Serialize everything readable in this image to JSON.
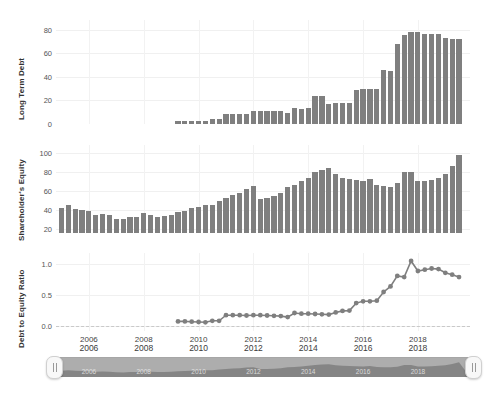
{
  "figure": {
    "background": "#ffffff",
    "bar_color": "#7f7f7f",
    "line_color": "#7f7f7f",
    "grid_color": "#f0f0f0"
  },
  "x_axis": {
    "ticks": [
      "2006",
      "2008",
      "2010",
      "2012",
      "2014",
      "2016",
      "2018"
    ],
    "tick_values": [
      2006,
      2008,
      2010,
      2012,
      2014,
      2016,
      2018
    ],
    "range": [
      2004.8,
      2019.9
    ]
  },
  "range_slider": {
    "ticks": [
      "2006",
      "2008",
      "2010",
      "2012",
      "2014",
      "2016",
      "2018"
    ],
    "inner_ticks": [
      "2006",
      "2008",
      "2010",
      "2012",
      "2014",
      "2016",
      "2018"
    ],
    "left_handle_label": "range-slider-left-handle",
    "right_handle_label": "range-slider-right-handle",
    "selected_start": "2004.8",
    "selected_end": "2019.9"
  },
  "chart_data": [
    {
      "type": "bar",
      "title": "",
      "ylabel": "Long Term Debt",
      "xlabel": "",
      "ylim": [
        0,
        88
      ],
      "yticks": [
        0,
        20,
        40,
        60,
        80
      ],
      "ytick_labels": [
        "0",
        "20",
        "40",
        "60",
        "80"
      ],
      "grid": true,
      "x": [
        2009.25,
        2009.5,
        2009.75,
        2010.0,
        2010.25,
        2010.5,
        2010.75,
        2011.0,
        2011.25,
        2011.5,
        2011.75,
        2012.0,
        2012.25,
        2012.5,
        2012.75,
        2013.0,
        2013.25,
        2013.5,
        2013.75,
        2014.0,
        2014.25,
        2014.5,
        2014.75,
        2015.0,
        2015.25,
        2015.5,
        2015.75,
        2016.0,
        2016.25,
        2016.5,
        2016.75,
        2017.0,
        2017.25,
        2017.5,
        2017.75,
        2018.0,
        2018.25,
        2018.5,
        2018.75,
        2019.0,
        2019.25,
        2019.5
      ],
      "values": [
        3.0,
        3.0,
        3.0,
        3.0,
        3.0,
        4.0,
        4.0,
        8.5,
        8.5,
        8.5,
        8.5,
        11.0,
        11.0,
        11.0,
        11.0,
        11.0,
        9.5,
        13.5,
        13.0,
        13.5,
        24.0,
        24.0,
        17.0,
        17.5,
        17.5,
        18.0,
        29.0,
        30.0,
        30.0,
        30.0,
        46.0,
        45.0,
        68.0,
        75.0,
        78.0,
        78.0,
        76.0,
        76.0,
        76.0,
        73.0,
        72.0,
        72.0
      ]
    },
    {
      "type": "bar",
      "title": "",
      "ylabel": "Shareholder's Equity",
      "xlabel": "",
      "ylim": [
        16,
        108
      ],
      "yticks": [
        20,
        40,
        60,
        80,
        100
      ],
      "ytick_labels": [
        "20",
        "40",
        "60",
        "80",
        "100"
      ],
      "grid": true,
      "x": [
        2005.0,
        2005.25,
        2005.5,
        2005.75,
        2006.0,
        2006.25,
        2006.5,
        2006.75,
        2007.0,
        2007.25,
        2007.5,
        2007.75,
        2008.0,
        2008.25,
        2008.5,
        2008.75,
        2009.0,
        2009.25,
        2009.5,
        2009.75,
        2010.0,
        2010.25,
        2010.5,
        2010.75,
        2011.0,
        2011.25,
        2011.5,
        2011.75,
        2012.0,
        2012.25,
        2012.5,
        2012.75,
        2013.0,
        2013.25,
        2013.5,
        2013.75,
        2014.0,
        2014.25,
        2014.5,
        2014.75,
        2015.0,
        2015.25,
        2015.5,
        2015.75,
        2016.0,
        2016.25,
        2016.5,
        2016.75,
        2017.0,
        2017.25,
        2017.5,
        2017.75,
        2018.0,
        2018.25,
        2018.5,
        2018.75,
        2019.0,
        2019.25,
        2019.5
      ],
      "values": [
        42.0,
        45.0,
        41.0,
        40.0,
        39.0,
        35.0,
        35.5,
        35.0,
        31.0,
        30.5,
        33.0,
        33.0,
        37.0,
        35.0,
        33.0,
        33.5,
        35.0,
        38.0,
        39.0,
        42.0,
        43.0,
        45.0,
        45.0,
        49.0,
        53.0,
        56.0,
        58.0,
        62.0,
        65.0,
        52.0,
        53.0,
        55.0,
        58.0,
        64.0,
        66.0,
        70.0,
        74.0,
        80.0,
        82.0,
        84.0,
        78.0,
        74.0,
        72.0,
        71.0,
        70.0,
        72.0,
        66.0,
        65.0,
        64.0,
        68.0,
        80.0,
        80.0,
        70.0,
        70.0,
        71.0,
        74.0,
        78.0,
        86.0,
        98.0
      ]
    },
    {
      "type": "line",
      "title": "",
      "ylabel": "Debt to Equity Ratio",
      "xlabel": "",
      "ylim": [
        -0.08,
        1.18
      ],
      "yticks": [
        0.0,
        0.5,
        1.0
      ],
      "ytick_labels": [
        "0.0",
        "0.5",
        "1.0"
      ],
      "grid": true,
      "markers": true,
      "x": [
        2009.25,
        2009.5,
        2009.75,
        2010.0,
        2010.25,
        2010.5,
        2010.75,
        2011.0,
        2011.25,
        2011.5,
        2011.75,
        2012.0,
        2012.25,
        2012.5,
        2012.75,
        2013.0,
        2013.25,
        2013.5,
        2013.75,
        2014.0,
        2014.25,
        2014.5,
        2014.75,
        2015.0,
        2015.25,
        2015.5,
        2015.75,
        2016.0,
        2016.25,
        2016.5,
        2016.75,
        2017.0,
        2017.25,
        2017.5,
        2017.75,
        2018.0,
        2018.25,
        2018.5,
        2018.75,
        2019.0,
        2019.25,
        2019.5
      ],
      "values": [
        0.075,
        0.075,
        0.07,
        0.065,
        0.06,
        0.085,
        0.085,
        0.175,
        0.175,
        0.175,
        0.17,
        0.175,
        0.175,
        0.17,
        0.165,
        0.16,
        0.145,
        0.21,
        0.2,
        0.2,
        0.195,
        0.19,
        0.185,
        0.22,
        0.245,
        0.25,
        0.37,
        0.4,
        0.4,
        0.41,
        0.55,
        0.64,
        0.81,
        0.79,
        1.05,
        0.89,
        0.91,
        0.93,
        0.92,
        0.86,
        0.83,
        0.79
      ]
    }
  ]
}
